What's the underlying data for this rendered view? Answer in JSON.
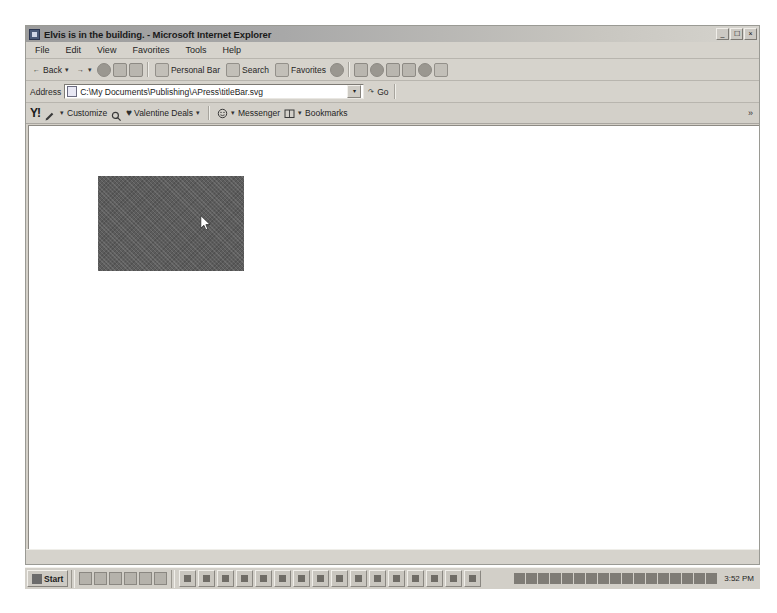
{
  "window": {
    "title": "Elvis is in the building. - Microsoft Internet Explorer",
    "app_icon": "ie-document-icon",
    "controls": {
      "minimize": "_",
      "restore": "❐",
      "close": "×"
    }
  },
  "menubar": {
    "items": [
      {
        "label": "File"
      },
      {
        "label": "Edit"
      },
      {
        "label": "View"
      },
      {
        "label": "Favorites"
      },
      {
        "label": "Tools"
      },
      {
        "label": "Help"
      }
    ]
  },
  "toolbar": {
    "back_label": "Back",
    "forward_label": "",
    "stop_icon": "stop-icon",
    "refresh_icon": "refresh-icon",
    "home_icon": "home-icon",
    "personal_bar_label": "Personal Bar",
    "search_label": "Search",
    "favorites_label": "Favorites",
    "history_icon": "history-icon",
    "mail_icon": "mail-icon",
    "print_icon": "print-icon",
    "edit_icon": "edit-icon",
    "discuss_icon": "discuss-icon",
    "messenger_icon": "messenger-icon",
    "realplayer_icon": "realplayer-icon"
  },
  "address": {
    "label": "Address",
    "value": "C:\\My Documents\\Publishing\\APress\\titleBar.svg",
    "placeholder": "",
    "doc_icon": "document-icon",
    "dropdown_icon": "chevron-down-icon",
    "go_label": "Go",
    "go_icon": "go-arrow-icon"
  },
  "yahoo_toolbar": {
    "logo": "Y!",
    "pencil_icon": "pencil-icon",
    "customize_label": "Customize",
    "search_icon": "search-icon",
    "heart_icon": "heart-icon",
    "valentine_label": "Valentine Deals",
    "valentine_dropdown": "chevron-down-icon",
    "messenger_icon": "messenger-smiley-icon",
    "messenger_label": "Messenger",
    "bookmarks_icon": "bookmarks-icon",
    "bookmarks_label": "Bookmarks",
    "overflow_label": "»"
  },
  "content": {
    "svg_rect": {
      "name": "svg-rectangle",
      "fill": "#5c5c5c",
      "x": 69,
      "y": 50,
      "width": 146,
      "height": 95
    },
    "cursor": {
      "name": "mouse-cursor",
      "x": 171,
      "y": 89
    }
  },
  "statusbar": {
    "text": ""
  },
  "taskbar": {
    "start_label": "Start",
    "quick_launch": [
      {
        "name": "show-desktop-icon"
      },
      {
        "name": "outlook-express-icon"
      },
      {
        "name": "internet-explorer-icon"
      },
      {
        "name": "media-player-icon"
      },
      {
        "name": "realplayer-icon"
      },
      {
        "name": "office-icon"
      }
    ],
    "tasks": [
      {
        "name": "task-button-1"
      },
      {
        "name": "task-button-2"
      },
      {
        "name": "task-button-3"
      },
      {
        "name": "task-button-4"
      },
      {
        "name": "task-button-5"
      },
      {
        "name": "task-button-6"
      },
      {
        "name": "task-button-7"
      },
      {
        "name": "task-button-8"
      },
      {
        "name": "task-button-9"
      },
      {
        "name": "task-button-10"
      },
      {
        "name": "task-button-11"
      },
      {
        "name": "task-button-12"
      },
      {
        "name": "task-button-13"
      },
      {
        "name": "task-button-14"
      },
      {
        "name": "task-button-15"
      },
      {
        "name": "task-button-16"
      }
    ],
    "tray_icons": [
      {
        "name": "tray-icon-1"
      },
      {
        "name": "tray-icon-2"
      },
      {
        "name": "tray-icon-3"
      },
      {
        "name": "tray-icon-4"
      },
      {
        "name": "tray-icon-5"
      },
      {
        "name": "tray-icon-6"
      },
      {
        "name": "tray-icon-7"
      },
      {
        "name": "tray-icon-8"
      },
      {
        "name": "tray-icon-9"
      },
      {
        "name": "tray-icon-10"
      },
      {
        "name": "tray-icon-11"
      },
      {
        "name": "tray-icon-12"
      },
      {
        "name": "tray-icon-13"
      },
      {
        "name": "tray-icon-14"
      },
      {
        "name": "tray-icon-15"
      },
      {
        "name": "tray-icon-16"
      },
      {
        "name": "tray-icon-17"
      }
    ],
    "clock": "3:52 PM"
  },
  "colors": {
    "chrome": "#d4d0c8",
    "titlebar_start": "#9c9c9c",
    "content_bg": "#ffffff",
    "svg_fill": "#5c5c5c"
  }
}
